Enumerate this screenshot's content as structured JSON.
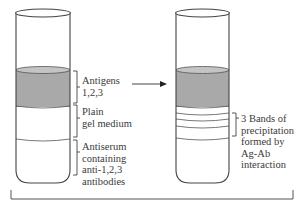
{
  "figure": {
    "left_tube": {
      "labels": {
        "antigens": [
          "Antigens",
          "1,2,3"
        ],
        "gel": [
          "Plain",
          "gel medium"
        ],
        "antiserum": [
          "Antiserum",
          "containing",
          "anti-1,2,3",
          "antibodies"
        ]
      }
    },
    "right_tube": {
      "labels": {
        "bands": [
          "3 Bands of",
          "precipitation",
          "formed by",
          "Ag-Ab",
          "interaction"
        ]
      },
      "band_count": 3
    },
    "colors": {
      "antigen_layer": "#a9a9a9",
      "antigen_top": "#c4c4c4",
      "outline": "#444444",
      "text": "#3a3a3a"
    }
  }
}
